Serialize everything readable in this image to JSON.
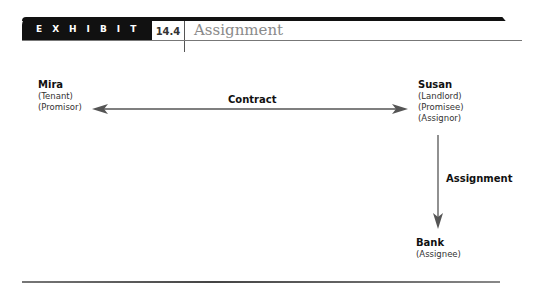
{
  "header": {
    "exhibit_label": "EXHIBIT",
    "exhibit_number": "14.4",
    "title": "Assignment"
  },
  "parties": {
    "mira": {
      "name": "Mira",
      "roles": [
        "(Tenant)",
        "(Promisor)"
      ]
    },
    "susan": {
      "name": "Susan",
      "roles": [
        "(Landlord)",
        "(Promisee)",
        "(Assignor)"
      ]
    },
    "bank": {
      "name": "Bank",
      "roles": [
        "(Assignee)"
      ]
    }
  },
  "relations": {
    "contract": {
      "label": "Contract",
      "from": "Mira",
      "to": "Susan",
      "direction": "bidirectional"
    },
    "assignment": {
      "label": "Assignment",
      "from": "Susan",
      "to": "Bank",
      "direction": "one-way"
    }
  },
  "colors": {
    "bar": "#111111",
    "title": "#8a8a8a",
    "arrow": "#555555"
  }
}
